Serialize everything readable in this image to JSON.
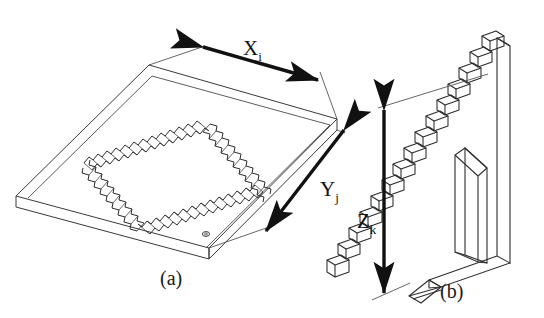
{
  "figure": {
    "background_color": "#ffffff",
    "line_color": "#2b2b2b",
    "arrow_color": "#111111",
    "text_color": "#141414",
    "panels": [
      {
        "id": "a",
        "caption": "(a)",
        "description": "isometric plate with serrated rectangular weld frame",
        "dimensions": [
          {
            "name": "x-dimension",
            "symbol": "X",
            "subscript": "i",
            "label": "Xi",
            "arrow": "double"
          },
          {
            "name": "y-dimension",
            "symbol": "Y",
            "subscript": "j",
            "label": "Yj",
            "arrow": "double"
          }
        ]
      },
      {
        "id": "b",
        "caption": "(b)",
        "description": "vertical wall bracket with triangular gusset and stepped staircase of blocks",
        "step_count": 14,
        "dimensions": [
          {
            "name": "z-dimension",
            "symbol": "Z",
            "subscript": "k",
            "label": "Zk",
            "arrow": "double"
          }
        ]
      }
    ]
  },
  "labels": {
    "x": {
      "symbol": "X",
      "sub": "i"
    },
    "y": {
      "symbol": "Y",
      "sub": "j"
    },
    "z": {
      "symbol": "Z",
      "sub": "k"
    },
    "caption_a": "(a)",
    "caption_b": "(b)"
  }
}
